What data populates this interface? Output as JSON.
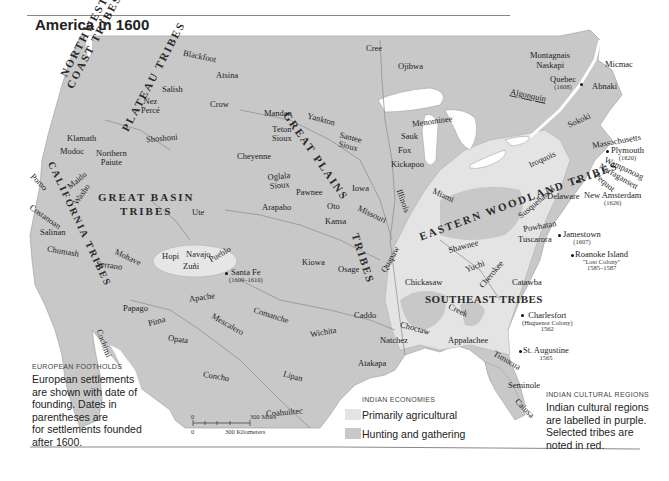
{
  "title": "America in 1600",
  "colors": {
    "land_hunting": "#c8c8c8",
    "land_agricultural": "#e4e4e4",
    "water": "#ffffff",
    "borders": "#8a8a8a"
  },
  "regions": [
    {
      "name": "NORTHWEST COAST TRIBES",
      "line1": "NORTHWEST",
      "line2": "COAST TRIBES"
    },
    {
      "name": "PLATEAU TRIBES"
    },
    {
      "name": "CALIFORNIA TRIBES"
    },
    {
      "name": "GREAT BASIN TRIBES",
      "line1": "GREAT BASIN",
      "line2": "TRIBES"
    },
    {
      "name": "GREAT PLAINS TRIBES",
      "line1": "GREAT PLAINS",
      "line2": "TRIBES"
    },
    {
      "name": "EASTERN WOODLAND TRIBES"
    },
    {
      "name": "SOUTHEAST TRIBES"
    }
  ],
  "tribes": {
    "blackfoot": "Blackfoot",
    "atsina": "Atsina",
    "salish": "Salish",
    "nez_perce_1": "Nez",
    "nez_perce_2": "Percé",
    "crow": "Crow",
    "shoshoni": "Shoshoni",
    "klamath": "Klamath",
    "modoc": "Modoc",
    "northern_paiute_1": "Northern",
    "northern_paiute_2": "Paiute",
    "pomo": "Pomo",
    "maidu": "Maidu",
    "washo": "Washo",
    "costanoan": "Costanoan",
    "salinan": "Salinan",
    "chumash": "Chumash",
    "serrano": "Serrano",
    "mohave": "Mohave",
    "ute": "Ute",
    "hopi": "Hopi",
    "navajo": "Navajo",
    "zuni": "Zuñi",
    "pueblo": "Pueblo",
    "apache": "Apache",
    "papago": "Papago",
    "pima": "Pima",
    "opata": "Opata",
    "cochimi": "Cochimi",
    "mescalero": "Mescalero",
    "concho": "Concho",
    "comanche": "Comanche",
    "lipan": "Lipan",
    "coahuiltec": "Coahuiltec",
    "wichita": "Wichita",
    "kiowa": "Kiowa",
    "osage": "Osage",
    "caddo": "Caddo",
    "atakapa": "Atakapa",
    "natchez": "Natchez",
    "choctaw": "Choctaw",
    "mandan": "Mandan",
    "yankton": "Yankton",
    "teton_sioux_1": "Teton",
    "teton_sioux_2": "Sioux",
    "santee_sioux_1": "Santee",
    "santee_sioux_2": "Sioux",
    "cheyenne": "Cheyenne",
    "oglala_sioux_1": "Oglala",
    "oglala_sioux_2": "Sioux",
    "pawnee": "Pawnee",
    "arapaho": "Arapaho",
    "iowa": "Iowa",
    "oto": "Oto",
    "kansa": "Kansa",
    "missouri": "Missouri",
    "quapaw": "Quapaw",
    "cree": "Cree",
    "ojibwa": "Ojibwa",
    "menominee": "Menominee",
    "sauk": "Sauk",
    "fox": "Fox",
    "kickapoo": "Kickapoo",
    "illinois": "Illinois",
    "miami": "Miami",
    "shawnee": "Shawnee",
    "chickasaw": "Chickasaw",
    "yuchi": "Yuchi",
    "cherokee": "Cherokee",
    "creek": "Creek",
    "appalachee": "Appalachee",
    "timucua": "Timucua",
    "seminole": "Seminole",
    "calusa": "Calusa",
    "catawba": "Catawba",
    "tuscarora": "Tuscarora",
    "powhatan": "Powhatan",
    "delaware": "Delaware",
    "susquehanna": "Susquehanna",
    "iroquois": "Iroquois",
    "sokoki": "Sokoki",
    "massachusetts": "Massachusetts",
    "wampanoag": "Wampanoag",
    "narragansett": "Narragansett",
    "pequot": "Pequot",
    "abnaki": "Abnaki",
    "micmac": "Micmac",
    "montagnais_1": "Montagnais",
    "montagnais_2": "Naskapi",
    "algonquin": "Algonquin"
  },
  "settlements": [
    {
      "name": "Quebec",
      "date": "(1608)"
    },
    {
      "name": "Plymouth",
      "date": "(1620)"
    },
    {
      "name": "New Amsterdam",
      "date": "(1626)"
    },
    {
      "name": "Jamestown",
      "date": "(1607)"
    },
    {
      "name": "Roanoke Island",
      "sub": "\"Lost Colony\"",
      "date": "1585–1587"
    },
    {
      "name": "Charlesfort",
      "sub": "(Huguenot Colony)",
      "date": "1562"
    },
    {
      "name": "St. Augustine",
      "date": "1565"
    },
    {
      "name": "Santa Fe",
      "date": "(1609–1610)"
    }
  ],
  "scale": {
    "miles": "300 Miles",
    "km": "300 Kilometers",
    "zero": "0"
  },
  "legends": {
    "european": {
      "heading": "EUROPEAN FOOTHOLDS",
      "lines": [
        "European settlements",
        "are shown with date of",
        "founding. Dates in",
        "parentheses are",
        "for settlements founded",
        "after 1600."
      ]
    },
    "economies": {
      "heading": "INDIAN ECONOMIES",
      "items": [
        {
          "label": "Primarily agricultural",
          "color": "#e4e4e4"
        },
        {
          "label": "Hunting and gathering",
          "color": "#c8c8c8"
        }
      ]
    },
    "cultural": {
      "heading": "INDIAN CULTURAL REGIONS",
      "lines": [
        "Indian cultural regions",
        "are labelled in purple.",
        "Selected tribes are",
        "noted in red."
      ]
    }
  }
}
